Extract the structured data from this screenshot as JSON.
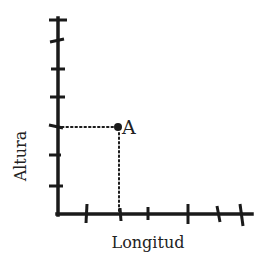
{
  "diagram": {
    "type": "coordinate-plane",
    "x_axis_label": "Longitud",
    "y_axis_label": "Altura",
    "point": {
      "label": "A",
      "x_px": 118,
      "y_px": 127
    },
    "colors": {
      "ink": "#1a1a1a",
      "background": "#ffffff"
    },
    "y_axis_ticks_px": [
      20,
      40,
      68,
      98,
      127,
      155,
      185
    ],
    "x_axis_ticks_px": [
      88,
      120,
      148,
      188,
      218,
      242
    ]
  }
}
